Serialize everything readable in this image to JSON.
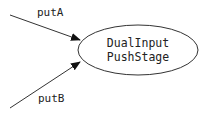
{
  "diagram": {
    "node": {
      "line1": "DualInput",
      "line2": "PushStage"
    },
    "edges": [
      {
        "label": "putA"
      },
      {
        "label": "putB"
      }
    ]
  }
}
